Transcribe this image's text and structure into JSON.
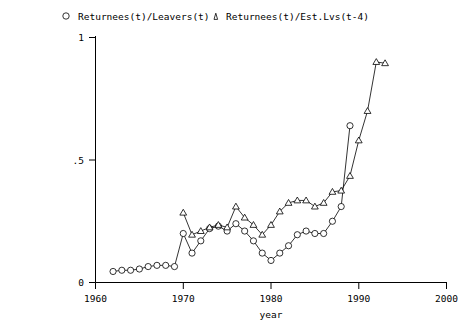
{
  "chart_data": {
    "type": "line",
    "title": "",
    "xlabel": "year",
    "ylabel": "",
    "xlim": [
      1960,
      2000
    ],
    "ylim": [
      0,
      1
    ],
    "xticks": [
      1960,
      1970,
      1980,
      1990,
      2000
    ],
    "xticklabels": [
      "1960",
      "1970",
      "1980",
      "1990",
      "2000"
    ],
    "yticks": [
      0,
      0.5,
      1
    ],
    "yticklabels": [
      "0",
      ".5",
      "1"
    ],
    "grid": false,
    "legend_position": "top",
    "series": [
      {
        "name": "Returnees(t)/Leavers(t)",
        "marker": "circle",
        "x": [
          1962,
          1963,
          1964,
          1965,
          1966,
          1967,
          1968,
          1969,
          1970,
          1971,
          1972,
          1973,
          1974,
          1975,
          1976,
          1977,
          1978,
          1979,
          1980,
          1981,
          1982,
          1983,
          1984,
          1985,
          1986,
          1987,
          1988,
          1989
        ],
        "y": [
          0.045,
          0.05,
          0.05,
          0.055,
          0.065,
          0.07,
          0.07,
          0.065,
          0.2,
          0.12,
          0.17,
          0.22,
          0.23,
          0.21,
          0.24,
          0.21,
          0.17,
          0.12,
          0.09,
          0.12,
          0.15,
          0.195,
          0.21,
          0.2,
          0.2,
          0.25,
          0.31,
          0.64
        ]
      },
      {
        "name": "Returnees(t)/Est.Lvs(t-4)",
        "marker": "triangle",
        "x": [
          1970,
          1971,
          1972,
          1973,
          1974,
          1975,
          1976,
          1977,
          1978,
          1979,
          1980,
          1981,
          1982,
          1983,
          1984,
          1985,
          1986,
          1987,
          1988,
          1989,
          1990,
          1991,
          1992,
          1993
        ],
        "y": [
          0.285,
          0.195,
          0.21,
          0.225,
          0.235,
          0.225,
          0.31,
          0.265,
          0.235,
          0.195,
          0.235,
          0.29,
          0.325,
          0.335,
          0.335,
          0.31,
          0.325,
          0.37,
          0.375,
          0.435,
          0.58,
          0.7,
          0.9,
          0.895
        ]
      }
    ]
  },
  "legend": {
    "entries": [
      {
        "marker": "circle-marker",
        "label": "Returnees(t)/Leavers(t)"
      },
      {
        "marker": "triangle-marker",
        "label": "Returnees(t)/Est.Lvs(t-4)"
      }
    ]
  },
  "axes": {
    "x_label": "year",
    "x_ticklabels": [
      "1960",
      "1970",
      "1980",
      "1990",
      "2000"
    ],
    "y_ticklabels": [
      "0",
      ".5",
      "1"
    ]
  },
  "colors": {
    "ink": "#000000",
    "background": "#ffffff"
  }
}
